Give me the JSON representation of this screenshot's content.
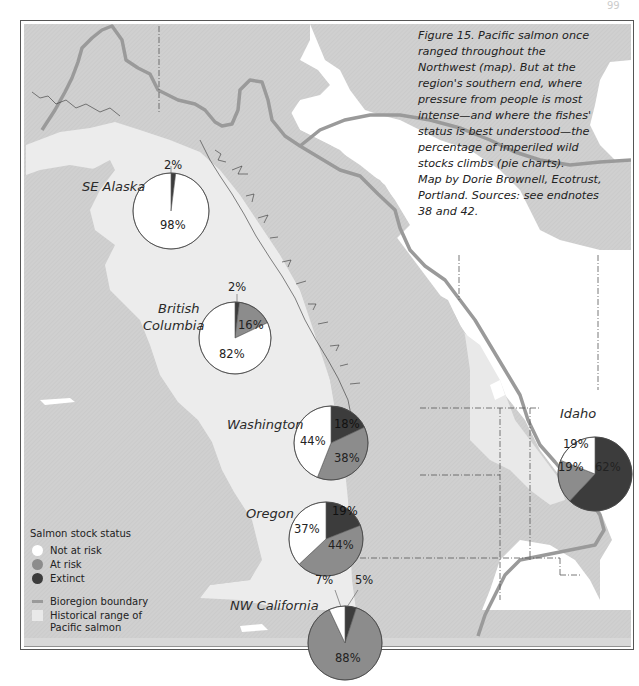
{
  "page_number": "99",
  "caption": {
    "lines": [
      "Figure 15. Pacific salmon once",
      "ranged throughout the",
      "Northwest (map). But at the",
      "region's southern end, where",
      "pressure from people is most",
      "intense—and where the fishes'",
      "status is best understood—the",
      "percentage of imperiled wild",
      "stocks climbs (pie charts).",
      "Map by Dorie Brownell, Ecotrust,",
      "Portland. Sources: see endnotes",
      "38 and 42."
    ]
  },
  "colors": {
    "not_at_risk": "#ffffff",
    "at_risk": "#8c8c8c",
    "extinct": "#3c3c3c",
    "land": "#d2d2d2",
    "historical_range": "#ececec",
    "bioregion_boundary": "#9a9a9a",
    "outside": "#ffffff"
  },
  "legend": {
    "title": "Salmon stock status",
    "items": [
      {
        "label": "Not at risk",
        "color": "#ffffff"
      },
      {
        "label": "At risk",
        "color": "#8c8c8c"
      },
      {
        "label": "Extinct",
        "color": "#3c3c3c"
      }
    ],
    "boundary_label": "Bioregion boundary",
    "range_label_1": "Historical range of",
    "range_label_2": "Pacific salmon"
  },
  "regions": [
    {
      "name": "SE Alaska",
      "not_at_risk": 98,
      "at_risk": 0,
      "extinct": 2,
      "labels": {
        "not_at_risk": "98%",
        "small": "2%"
      }
    },
    {
      "name": "British Columbia",
      "not_at_risk": 82,
      "at_risk": 16,
      "extinct": 2,
      "labels": {
        "not_at_risk": "82%",
        "at_risk": "16%",
        "extinct": "2%"
      }
    },
    {
      "name": "Washington",
      "not_at_risk": 44,
      "at_risk": 38,
      "extinct": 18,
      "labels": {
        "not_at_risk": "44%",
        "at_risk": "38%",
        "extinct": "18%"
      }
    },
    {
      "name": "Oregon",
      "not_at_risk": 37,
      "at_risk": 44,
      "extinct": 19,
      "labels": {
        "not_at_risk": "37%",
        "at_risk": "44%",
        "extinct": "19%"
      }
    },
    {
      "name": "NW California",
      "not_at_risk": 7,
      "at_risk": 88,
      "extinct": 5,
      "labels": {
        "not_at_risk": "7%",
        "at_risk": "88%",
        "extinct": "5%"
      }
    },
    {
      "name": "Idaho",
      "not_at_risk": 19,
      "at_risk": 19,
      "extinct": 62,
      "labels": {
        "not_at_risk": "19%",
        "at_risk": "19%",
        "extinct": "62%"
      }
    }
  ],
  "region_labels": {
    "se_alaska": "SE Alaska",
    "british_columbia_1": "British",
    "british_columbia_2": "Columbia",
    "washington": "Washington",
    "oregon": "Oregon",
    "nw_california": "NW California",
    "idaho": "Idaho"
  },
  "chart_data": {
    "type": "pie",
    "legend_position": "lower-left",
    "categories": [
      "Not at risk",
      "At risk",
      "Extinct"
    ],
    "series": [
      {
        "name": "SE Alaska",
        "values": [
          98,
          0,
          2
        ]
      },
      {
        "name": "British Columbia",
        "values": [
          82,
          16,
          2
        ]
      },
      {
        "name": "Washington",
        "values": [
          44,
          38,
          18
        ]
      },
      {
        "name": "Oregon",
        "values": [
          37,
          44,
          19
        ]
      },
      {
        "name": "NW California",
        "values": [
          7,
          88,
          5
        ]
      },
      {
        "name": "Idaho",
        "values": [
          19,
          19,
          62
        ]
      }
    ]
  }
}
